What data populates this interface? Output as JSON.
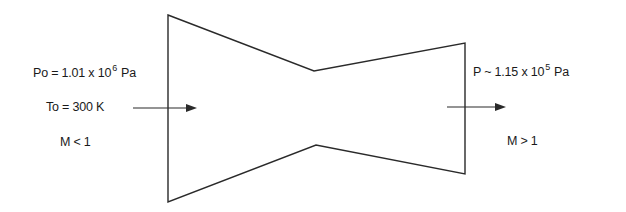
{
  "diagram": {
    "type": "converging-diverging nozzle",
    "inlet": {
      "pressure": {
        "symbol": "Po",
        "relation": "=",
        "mantissa": "1.01 x 10",
        "exponent": "6",
        "unit": "Pa"
      },
      "temperature": "To = 300 K",
      "mach": "M < 1"
    },
    "outlet": {
      "pressure": {
        "symbol": "P",
        "relation": "~",
        "mantissa": "1.15 x 10",
        "exponent": "5",
        "unit": "Pa"
      },
      "mach": "M > 1"
    },
    "colors": {
      "line": "#2a2a2a",
      "background": "#ffffff"
    }
  }
}
